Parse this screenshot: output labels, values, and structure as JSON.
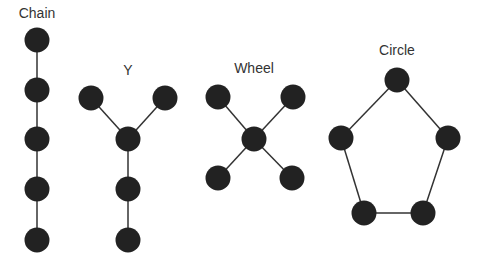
{
  "colors": {
    "node": "#222222",
    "edge": "#333333",
    "label": "#333333",
    "background": "#ffffff"
  },
  "node_radius": 12.5,
  "networks": [
    {
      "name": "Chain",
      "label_pos": [
        37,
        18
      ],
      "nodes": [
        [
          37,
          40
        ],
        [
          37,
          90
        ],
        [
          37,
          139
        ],
        [
          37,
          189
        ],
        [
          37,
          240
        ]
      ],
      "edges": [
        [
          0,
          1
        ],
        [
          1,
          2
        ],
        [
          2,
          3
        ],
        [
          3,
          4
        ]
      ]
    },
    {
      "name": "Y",
      "label_pos": [
        128,
        75
      ],
      "nodes": [
        [
          91,
          98
        ],
        [
          165,
          98
        ],
        [
          128,
          139
        ],
        [
          128,
          189
        ],
        [
          128,
          240
        ]
      ],
      "edges": [
        [
          0,
          2
        ],
        [
          1,
          2
        ],
        [
          2,
          3
        ],
        [
          3,
          4
        ]
      ]
    },
    {
      "name": "Wheel",
      "label_pos": [
        254,
        73
      ],
      "nodes": [
        [
          218,
          97
        ],
        [
          293,
          97
        ],
        [
          254,
          139
        ],
        [
          218,
          178
        ],
        [
          292,
          178
        ]
      ],
      "edges": [
        [
          0,
          2
        ],
        [
          1,
          2
        ],
        [
          3,
          2
        ],
        [
          4,
          2
        ]
      ]
    },
    {
      "name": "Circle",
      "label_pos": [
        397,
        55
      ],
      "nodes": [
        [
          397,
          80
        ],
        [
          448,
          138
        ],
        [
          423,
          213
        ],
        [
          364,
          213
        ],
        [
          341,
          138
        ]
      ],
      "edges": [
        [
          0,
          1
        ],
        [
          1,
          2
        ],
        [
          2,
          3
        ],
        [
          3,
          4
        ],
        [
          4,
          0
        ]
      ]
    }
  ]
}
